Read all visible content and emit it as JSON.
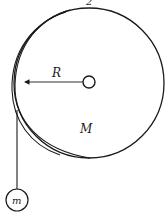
{
  "diagram": {
    "type": "pulley-disk-with-hanging-mass",
    "labels": {
      "top": "2",
      "radius": "R",
      "disk_mass": "M",
      "hanging_mass": "m"
    },
    "colors": {
      "stroke": "#1a1a1a",
      "background": "#ffffff"
    }
  }
}
